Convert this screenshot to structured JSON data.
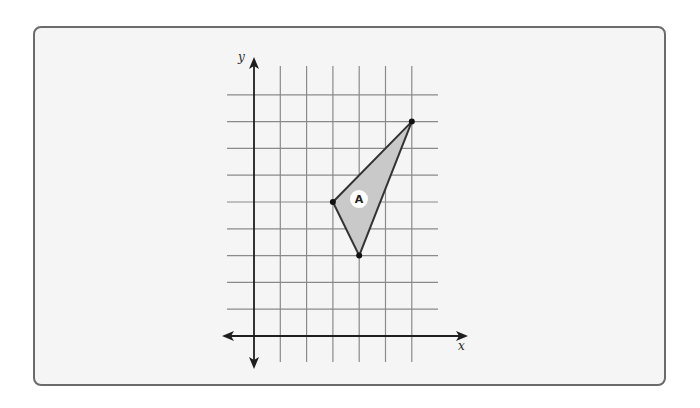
{
  "figure": {
    "type": "coordinate-grid",
    "axes": {
      "x_label": "x",
      "y_label": "y",
      "origin_px": [
        254,
        336
      ],
      "unit_px": [
        26.3,
        26.8
      ],
      "grid_x_count": 6,
      "grid_y_count": 9
    },
    "shapes": [
      {
        "label": "A",
        "vertices": [
          [
            6,
            8
          ],
          [
            3,
            5
          ],
          [
            4,
            3
          ]
        ],
        "fill": "#c9c9c9",
        "stroke": "#333333"
      }
    ]
  },
  "colors": {
    "panel_border": "#6b6b6b",
    "panel_background": "#f5f5f5",
    "grid": "#8a8a8a",
    "axis": "#1e1e1e"
  }
}
